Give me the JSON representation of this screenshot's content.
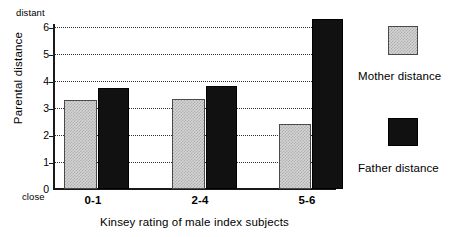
{
  "chart_data": {
    "type": "bar",
    "title": "",
    "xlabel": "Kinsey rating of male index subjects",
    "ylabel": "Parental distance",
    "categories": [
      "0-1",
      "2-4",
      "5-6"
    ],
    "series": [
      {
        "name": "Mother distance",
        "values": [
          3.3,
          3.35,
          2.4
        ],
        "color": "#d4d4d4"
      },
      {
        "name": "Father distance",
        "values": [
          3.75,
          3.8,
          6.3
        ],
        "color": "#111111"
      }
    ],
    "ylim": [
      0,
      6.5
    ],
    "yticks": [
      0,
      1,
      2,
      3,
      4,
      5,
      6
    ],
    "ytick_labels": [
      "0",
      "1",
      "2",
      "3",
      "4",
      "5",
      "6"
    ],
    "axis_end_labels": {
      "top": "distant",
      "bottom": "close"
    },
    "grid": "horizontal-dotted",
    "legend_position": "right"
  },
  "legend": {
    "entries": [
      {
        "label": "Mother distance",
        "swatch": "grey-hatched-square"
      },
      {
        "label": "Father distance",
        "swatch": "black-square"
      }
    ]
  }
}
